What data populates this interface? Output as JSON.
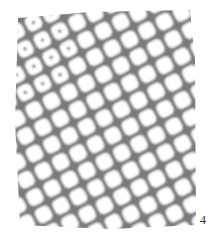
{
  "figure": {
    "panel_label": "4",
    "lattice": {
      "spacing": 19.5,
      "angle_deg": -27,
      "cell_size": 15.5,
      "corner_radius": 5,
      "origin": [
        104,
        118
      ],
      "range": [
        -7,
        7
      ]
    },
    "region": {
      "x": 15,
      "y": 13,
      "width": 180,
      "height": 215
    },
    "colors": {
      "background": "#ffffff",
      "gap": "#7a7a7a",
      "gap_dark": "#5e5e5e",
      "cell": "#ffffff",
      "dot": "#555555"
    },
    "dotted_cells_region": {
      "x_max": 75,
      "y_max": 105,
      "note": "cells with center dots appear in the upper-left area"
    }
  }
}
